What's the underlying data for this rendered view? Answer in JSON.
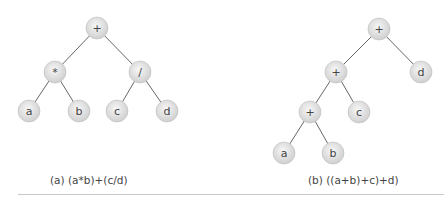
{
  "colors": {
    "node_fill_center": "#f4f4f4",
    "node_fill_edge": "#cfcfcf",
    "node_stroke": "#bdbdbd",
    "edge": "#555555",
    "text": "#444444"
  },
  "trees": [
    {
      "caption": "(a) (a*b)+(c/d)",
      "caption_pos": [
        50,
        176
      ],
      "nodes": [
        {
          "id": "root",
          "label": "+",
          "x": 97,
          "y": 28
        },
        {
          "id": "mul",
          "label": "*",
          "x": 55,
          "y": 72
        },
        {
          "id": "div",
          "label": "/",
          "x": 140,
          "y": 72
        },
        {
          "id": "a",
          "label": "a",
          "x": 29,
          "y": 111
        },
        {
          "id": "b",
          "label": "b",
          "x": 79,
          "y": 111
        },
        {
          "id": "c",
          "label": "c",
          "x": 117,
          "y": 111
        },
        {
          "id": "d",
          "label": "d",
          "x": 167,
          "y": 111
        }
      ],
      "edges": [
        [
          "root",
          "mul"
        ],
        [
          "root",
          "div"
        ],
        [
          "mul",
          "a"
        ],
        [
          "mul",
          "b"
        ],
        [
          "div",
          "c"
        ],
        [
          "div",
          "d"
        ]
      ]
    },
    {
      "caption": "(b) ((a+b)+c)+d)",
      "caption_pos": [
        308,
        176
      ],
      "nodes": [
        {
          "id": "root",
          "label": "+",
          "x": 379,
          "y": 29
        },
        {
          "id": "p2",
          "label": "+",
          "x": 336,
          "y": 72
        },
        {
          "id": "d",
          "label": "d",
          "x": 421,
          "y": 72
        },
        {
          "id": "p3",
          "label": "+",
          "x": 310,
          "y": 112
        },
        {
          "id": "c",
          "label": "c",
          "x": 359,
          "y": 112
        },
        {
          "id": "a",
          "label": "a",
          "x": 284,
          "y": 153
        },
        {
          "id": "b",
          "label": "b",
          "x": 333,
          "y": 153
        }
      ],
      "edges": [
        [
          "root",
          "p2"
        ],
        [
          "root",
          "d"
        ],
        [
          "p2",
          "p3"
        ],
        [
          "p2",
          "c"
        ],
        [
          "p3",
          "a"
        ],
        [
          "p3",
          "b"
        ]
      ]
    }
  ]
}
